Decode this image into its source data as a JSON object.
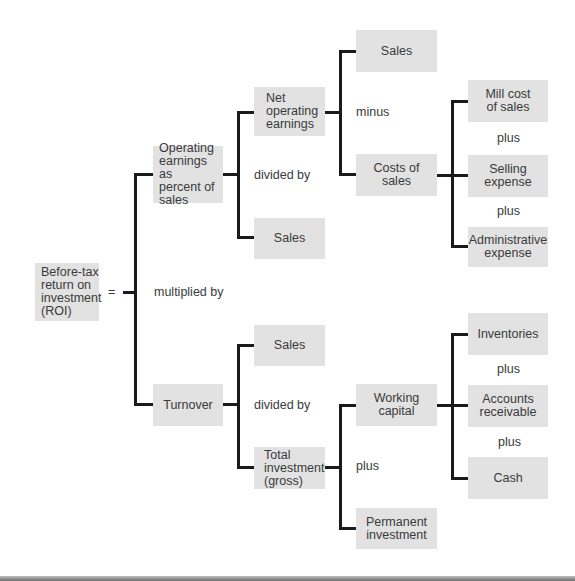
{
  "diagram": {
    "nodes": {
      "roi": "Before-tax\nreturn on\ninvestment\n(ROI)",
      "operating_earnings_pct": "Operating\nearnings as\npercent of\nsales",
      "turnover": "Turnover",
      "net_operating_earnings": "Net\noperating\nearnings",
      "sales_oe": "Sales",
      "sales_turnover": "Sales",
      "total_investment": "Total\ninvestment\n(gross)",
      "sales_top": "Sales",
      "costs_of_sales": "Costs of sales",
      "mill_cost": "Mill cost\nof sales",
      "selling_expense": "Selling\nexpense",
      "administrative_expense": "Administrative\nexpense",
      "working_capital": "Working\ncapital",
      "permanent_investment": "Permanent\ninvestment",
      "inventories": "Inventories",
      "accounts_receivable": "Accounts\nreceivable",
      "cash": "Cash"
    },
    "operators": {
      "equals": "=",
      "multiplied_by": "multiplied by",
      "divided_by_oe": "divided by",
      "divided_by_turnover": "divided by",
      "minus": "minus",
      "plus_costs_1": "plus",
      "plus_costs_2": "plus",
      "plus_investment": "plus",
      "plus_wc_1": "plus",
      "plus_wc_2": "plus"
    },
    "colors": {
      "box_fill": "#e2e2e2",
      "line": "#1a1a1a",
      "text": "#3a3a3a",
      "background": "#ffffff"
    }
  }
}
